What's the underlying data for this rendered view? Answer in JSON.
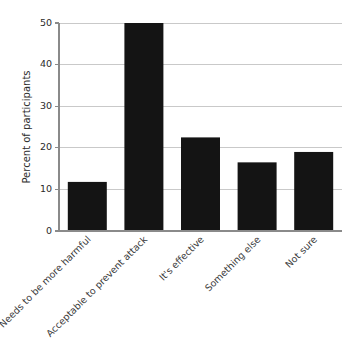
{
  "chart_data": {
    "type": "bar",
    "title": "",
    "subtitle": "",
    "xlabel": "",
    "ylabel": "Percent of participants",
    "categories": [
      "Needs to be more harmful",
      "Acceptable to prevent attack",
      "It's effective",
      "Something else",
      "Not sure"
    ],
    "values": [
      11.8,
      50.0,
      22.5,
      16.5,
      19.0
    ],
    "ylim": [
      0,
      50
    ],
    "yticks": [
      0,
      10,
      20,
      30,
      40,
      50
    ],
    "ytick_labels": [
      "0",
      "10",
      "20",
      "30",
      "40",
      "50"
    ],
    "grid": true,
    "grid_axis": "y",
    "legend": false,
    "legend_position": "none",
    "bar_color": "#141414",
    "grid_color": "#c9c9c9",
    "axis_color": "#8a8a8a",
    "xtick_label_rotation": 45
  },
  "layout": {
    "plot_left": 59,
    "plot_right": 342,
    "plot_top": 23,
    "plot_bottom": 231,
    "bar_width": 39,
    "ylabel_x": 30,
    "ylabel_y": 127
  }
}
